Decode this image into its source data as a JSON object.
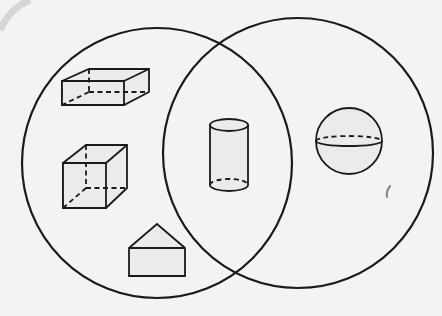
{
  "diagram": {
    "type": "venn",
    "title": "",
    "sets": [
      {
        "id": "left",
        "label": "",
        "center": [
          157,
          163
        ],
        "radius": 135
      },
      {
        "id": "right",
        "label": "",
        "center": [
          298,
          153
        ],
        "radius": 135
      }
    ],
    "regions": {
      "left_only": [
        "rectangular prism",
        "cube",
        "triangular prism"
      ],
      "intersection": [
        "cylinder"
      ],
      "right_only": [
        "sphere"
      ]
    },
    "shapes": [
      {
        "name": "rectangular prism",
        "region": "left_only"
      },
      {
        "name": "cube",
        "region": "left_only"
      },
      {
        "name": "triangular prism",
        "region": "left_only"
      },
      {
        "name": "cylinder",
        "region": "intersection"
      },
      {
        "name": "sphere",
        "region": "right_only"
      }
    ],
    "colors": {
      "background": "#f3f3f1",
      "stroke": "#1a1a1a",
      "shape_fill": "#ebebea"
    }
  }
}
